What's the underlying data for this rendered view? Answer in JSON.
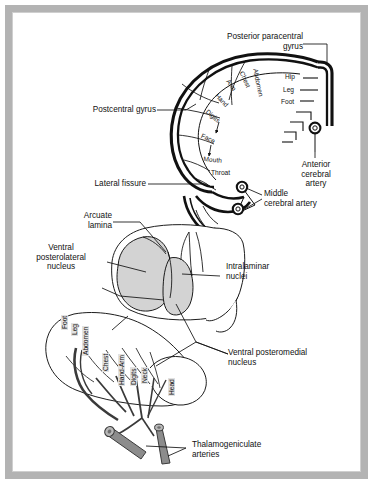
{
  "figure": {
    "background_color": "#ffffff",
    "frame_color": "#b3b3b3",
    "ink_color": "#111111",
    "nucleus_shade_color": "#d3d3d3",
    "vessel_color": "#8c8c8c"
  },
  "upper_panel": {
    "name": "cortical-homunculus-panel",
    "labels": {
      "posterior_paracentral_gyrus": "Posterior paracentral\ngyrus",
      "postcentral_gyrus": "Postcentral gyrus",
      "lateral_fissure": "Lateral fissure",
      "anterior_cerebral_artery": "Anterior\ncerebral\nartery",
      "middle_cerebral_artery": "Middle\ncerebral artery"
    },
    "homunculus_medial": [
      "Hip",
      "Leg",
      "Foot"
    ],
    "homunculus_lateral": [
      "Abdomen",
      "Chest",
      "Arm",
      "Hand",
      "Digits",
      "Face",
      "Mouth",
      "Throat"
    ],
    "artery_markers": 3
  },
  "lower_panel": {
    "name": "thalamus-panel",
    "labels": {
      "arcuate_lamina": "Arcuate\nlamina",
      "ventral_posterolateral_nucleus": "Ventral\nposterolateral\nnucleus",
      "intralaminar_nuclei": "Intralaminar\nnuclei",
      "ventral_posteromedial_nucleus": "Ventral posteromedial\nnucleus",
      "thalamogeniculate_arteries": "Thalamogeniculate\narteries"
    },
    "homunculus_body": [
      "Foot",
      "Leg",
      "Abdomen",
      "Chest",
      "Hand-Arm",
      "Digits",
      "Neck",
      "Head"
    ],
    "shaded_nuclei": [
      "ventral posterolateral nucleus",
      "ventral posteromedial nucleus"
    ],
    "artery_stumps": 2
  }
}
